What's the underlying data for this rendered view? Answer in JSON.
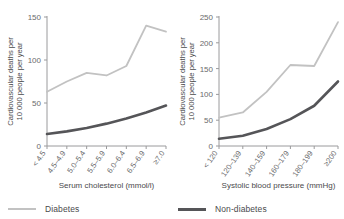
{
  "legend": {
    "items": [
      {
        "label": "Diabetes",
        "color": "#c2c2c2",
        "key": "diabetes"
      },
      {
        "label": "Non-diabetes",
        "color": "#555558",
        "key": "nondiabetes"
      }
    ]
  },
  "axis_label_line1": "Cardiovascular deaths per",
  "axis_label_line2": "10 000 people per year",
  "chart_data": [
    {
      "type": "line",
      "title": "",
      "xlabel": "Serum cholesterol (mmol/l)",
      "ylabel": "Cardiovascular deaths per 10 000 people per year",
      "categories": [
        "< 4.5",
        "4.5–4.9",
        "5.0–5.4",
        "5.5–5.9",
        "6.0–6.4",
        "6.5–6.9",
        "≥7.0"
      ],
      "yticks": [
        0,
        50,
        100,
        150
      ],
      "ylim": [
        0,
        150
      ],
      "grid": false,
      "legend_position": "below-figure",
      "series": [
        {
          "name": "Diabetes",
          "color": "#c2c2c2",
          "values": [
            63,
            75,
            85,
            82,
            93,
            140,
            133
          ]
        },
        {
          "name": "Non-diabetes",
          "color": "#555558",
          "values": [
            14,
            17,
            21,
            26,
            32,
            39,
            47
          ]
        }
      ]
    },
    {
      "type": "line",
      "title": "",
      "xlabel": "Systolic blood pressure (mmHg)",
      "ylabel": "Cardiovascular deaths per 10 000 people per year",
      "categories": [
        "< 120",
        "120–139",
        "140–159",
        "160–179",
        "180–199",
        "≥200"
      ],
      "yticks": [
        0,
        50,
        100,
        150,
        200,
        250
      ],
      "ylim": [
        0,
        250
      ],
      "grid": false,
      "legend_position": "below-figure",
      "series": [
        {
          "name": "Diabetes",
          "color": "#c2c2c2",
          "values": [
            55,
            65,
            105,
            157,
            155,
            240
          ]
        },
        {
          "name": "Non-diabetes",
          "color": "#555558",
          "values": [
            14,
            20,
            33,
            52,
            78,
            125
          ]
        }
      ]
    }
  ]
}
